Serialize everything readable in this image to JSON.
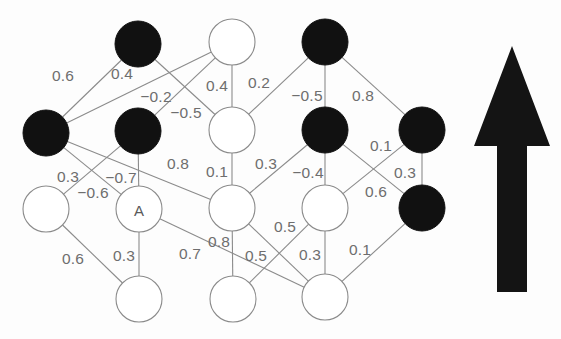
{
  "figure": {
    "background_color": "#fdfdfd",
    "edge_color": "#8b8b8b",
    "filled_node_color": "#111111",
    "open_node_fill": "#ffffff",
    "label_color": "#6e6e6e",
    "arrow_color": "#141414"
  },
  "chart_data": {
    "type": "diagram",
    "title": "",
    "nodes": [
      {
        "id": "n1",
        "label": "",
        "x": 138,
        "y": 44,
        "r": 23,
        "state": "filled",
        "row": 1,
        "col": 2
      },
      {
        "id": "n2",
        "label": "",
        "x": 232,
        "y": 42,
        "r": 23,
        "state": "open",
        "row": 1,
        "col": 3
      },
      {
        "id": "n3",
        "label": "",
        "x": 325,
        "y": 42,
        "r": 23,
        "state": "filled",
        "row": 1,
        "col": 4
      },
      {
        "id": "n4",
        "label": "",
        "x": 46,
        "y": 133,
        "r": 23,
        "state": "filled",
        "row": 2,
        "col": 1
      },
      {
        "id": "n5",
        "label": "",
        "x": 138,
        "y": 131,
        "r": 23,
        "state": "filled",
        "row": 2,
        "col": 2
      },
      {
        "id": "n6",
        "label": "",
        "x": 232,
        "y": 130,
        "r": 23,
        "state": "open",
        "row": 2,
        "col": 3
      },
      {
        "id": "n7",
        "label": "",
        "x": 325,
        "y": 130,
        "r": 23,
        "state": "filled",
        "row": 2,
        "col": 4
      },
      {
        "id": "n8",
        "label": "",
        "x": 422,
        "y": 130,
        "r": 23,
        "state": "filled",
        "row": 2,
        "col": 5
      },
      {
        "id": "n9",
        "label": "",
        "x": 46,
        "y": 209,
        "r": 23,
        "state": "open",
        "row": 3,
        "col": 1
      },
      {
        "id": "n10",
        "label": "A",
        "x": 139,
        "y": 209,
        "r": 23,
        "state": "open",
        "row": 3,
        "col": 2
      },
      {
        "id": "n11",
        "label": "",
        "x": 232,
        "y": 208,
        "r": 23,
        "state": "open",
        "row": 3,
        "col": 3
      },
      {
        "id": "n12",
        "label": "",
        "x": 325,
        "y": 208,
        "r": 23,
        "state": "open",
        "row": 3,
        "col": 4
      },
      {
        "id": "n13",
        "label": "",
        "x": 422,
        "y": 208,
        "r": 23,
        "state": "filled",
        "row": 3,
        "col": 5
      },
      {
        "id": "n14",
        "label": "",
        "x": 139,
        "y": 299,
        "r": 23,
        "state": "open",
        "row": 4,
        "col": 2
      },
      {
        "id": "n15",
        "label": "",
        "x": 233,
        "y": 299,
        "r": 23,
        "state": "open",
        "row": 4,
        "col": 3
      },
      {
        "id": "n16",
        "label": "",
        "x": 325,
        "y": 297,
        "r": 23,
        "state": "open",
        "row": 4,
        "col": 4
      }
    ],
    "edges": [
      {
        "from": "n4",
        "to": "n1",
        "weight": "0.6",
        "lx": 63,
        "ly": 75
      },
      {
        "from": "n4",
        "to": "n2",
        "weight": "0.4",
        "lx": 122,
        "ly": 73
      },
      {
        "from": "n1",
        "to": "n6",
        "weight": "-0.2",
        "lx": 156,
        "ly": 96
      },
      {
        "from": "n5",
        "to": "n2",
        "weight": "-0.5",
        "lx": 186,
        "ly": 112
      },
      {
        "from": "n2",
        "to": "n6",
        "weight": "0.4",
        "lx": 217,
        "ly": 85
      },
      {
        "from": "n6",
        "to": "n3",
        "weight": "0.2",
        "lx": 259,
        "ly": 82
      },
      {
        "from": "n3",
        "to": "n7",
        "weight": "-0.5",
        "lx": 307,
        "ly": 95
      },
      {
        "from": "n3",
        "to": "n8",
        "weight": "0.8",
        "lx": 363,
        "ly": 95
      },
      {
        "from": "n4",
        "to": "n11",
        "weight": "0.8",
        "lx": 178,
        "ly": 163
      },
      {
        "from": "n6",
        "to": "n11",
        "weight": "0.1",
        "lx": 217,
        "ly": 171
      },
      {
        "from": "n11",
        "to": "n7",
        "weight": "0.3",
        "lx": 266,
        "ly": 163
      },
      {
        "from": "n7",
        "to": "n12",
        "weight": "-0.4",
        "lx": 308,
        "ly": 172
      },
      {
        "from": "n7",
        "to": "n13",
        "weight": "0.1",
        "lx": 381,
        "ly": 145
      },
      {
        "from": "n8",
        "to": "n13",
        "weight": "0.3",
        "lx": 405,
        "ly": 172
      },
      {
        "from": "n12",
        "to": "n8",
        "weight": "0.6",
        "lx": 376,
        "ly": 191
      },
      {
        "from": "n4",
        "to": "n10",
        "weight": "0.3",
        "lx": 68,
        "ly": 176
      },
      {
        "from": "n5",
        "to": "n9",
        "weight": "-0.7",
        "lx": 121,
        "ly": 177
      },
      {
        "from": "n5",
        "to": "n10",
        "weight": "-0.6",
        "lx": 93,
        "ly": 192
      },
      {
        "from": "n9",
        "to": "n14",
        "weight": "0.6",
        "lx": 73,
        "ly": 258
      },
      {
        "from": "n10",
        "to": "n14",
        "weight": "0.3",
        "lx": 124,
        "ly": 255
      },
      {
        "from": "n10",
        "to": "n16",
        "weight": "0.7",
        "lx": 190,
        "ly": 253
      },
      {
        "from": "n11",
        "to": "n15",
        "weight": "0.8",
        "lx": 219,
        "ly": 241
      },
      {
        "from": "n12",
        "to": "n15",
        "weight": "0.5",
        "lx": 285,
        "ly": 226
      },
      {
        "from": "n11",
        "to": "n16",
        "weight": "0.5",
        "lx": 256,
        "ly": 255
      },
      {
        "from": "n12",
        "to": "n16",
        "weight": "0.3",
        "lx": 310,
        "ly": 254
      },
      {
        "from": "n16",
        "to": "n13",
        "weight": "0.1",
        "lx": 360,
        "ly": 249
      }
    ],
    "annotations": [
      {
        "name": "direction-arrow",
        "shape": "up-arrow",
        "x": 512,
        "y": 170
      }
    ]
  },
  "arrow": {
    "name": "up-arrow",
    "direction": "up",
    "tip_x": 512,
    "tip_y": 46,
    "base_y": 292
  }
}
